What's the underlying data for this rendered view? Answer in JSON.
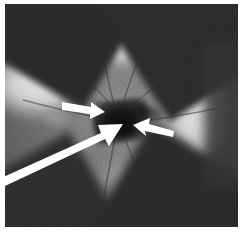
{
  "figure": {
    "kind": "fundus-photograph",
    "modality": "retinal colour fundus photograph (greyscale reproduction)",
    "caption": "",
    "width_px": 243,
    "height_px": 238,
    "plate": {
      "left_px": 5,
      "top_px": 4,
      "width_px": 233,
      "height_px": 223,
      "background_color": "#6e6e6e",
      "border_color": "#ffffff"
    }
  },
  "palette": {
    "arrow_color": "#ffffff",
    "lesion_dark": "#0d0d0d",
    "retina_midtone": "#7d7d7d",
    "exudate_bright": "#f4f4f4",
    "vignette_dark": "#2a2a2a",
    "page_background": "#ffffff"
  },
  "annotations": {
    "arrows": [
      {
        "id": "arrow-upper-left",
        "label": "",
        "direction": "points-right",
        "tail_px": [
          62,
          104
        ],
        "tip_px": [
          100,
          112
        ],
        "color": "#ffffff",
        "length_px": 39,
        "style": "short-straight-arrow"
      },
      {
        "id": "arrow-long-lower-left",
        "label": "",
        "direction": "points-upper-right",
        "tail_px": [
          0,
          176
        ],
        "tip_px": [
          121,
          124
        ],
        "color": "#ffffff",
        "length_px": 132,
        "style": "long-thick-arrow"
      },
      {
        "id": "arrow-right",
        "label": "",
        "direction": "points-left",
        "tail_px": [
          172,
          133
        ],
        "tip_px": [
          133,
          125
        ],
        "color": "#ffffff",
        "length_px": 40,
        "style": "short-straight-arrow"
      }
    ],
    "target": {
      "name": "optic-disc-lesion",
      "center_px": [
        114,
        118
      ],
      "description": "dark central lesion at the optic nerve head"
    }
  },
  "features": [
    {
      "name": "bright-exudate-superior",
      "center_px": [
        120,
        24
      ],
      "tone": "bright"
    },
    {
      "name": "bright-exudate-left",
      "center_px": [
        22,
        84
      ],
      "tone": "bright"
    },
    {
      "name": "bright-exudate-right",
      "center_px": [
        196,
        98
      ],
      "tone": "bright"
    },
    {
      "name": "vignette-corner-top-left",
      "center_px": [
        18,
        16
      ],
      "tone": "dark"
    },
    {
      "name": "vignette-corner-top-right",
      "center_px": [
        220,
        22
      ],
      "tone": "dark"
    },
    {
      "name": "vignette-corner-bottom-left",
      "center_px": [
        18,
        210
      ],
      "tone": "dark"
    },
    {
      "name": "vignette-corner-bottom-right",
      "center_px": [
        216,
        208
      ],
      "tone": "dark"
    }
  ]
}
